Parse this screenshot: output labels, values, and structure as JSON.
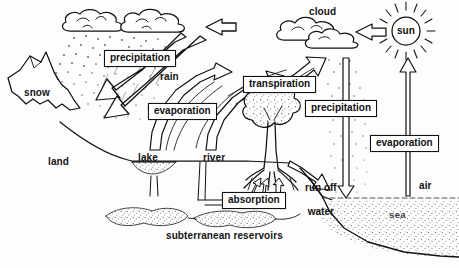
{
  "diagram": {
    "style": "hand-drawn black and white line illustration",
    "background_color": "#fdfdfc",
    "ink_color": "#111111"
  },
  "boxed_labels": [
    {
      "id": "precipitation-left",
      "text": "precipitation",
      "x": 104,
      "y": 50,
      "w": 74
    },
    {
      "id": "evaporation-left",
      "text": "evaporation",
      "x": 148,
      "y": 103,
      "w": 75
    },
    {
      "id": "transpiration",
      "text": "transpiration",
      "x": 243,
      "y": 76,
      "w": 75
    },
    {
      "id": "precipitation-right",
      "text": "precipitation",
      "x": 305,
      "y": 100,
      "w": 74
    },
    {
      "id": "evaporation-right",
      "text": "evaporation",
      "x": 370,
      "y": 135,
      "w": 75
    },
    {
      "id": "absorption",
      "text": "absorption",
      "x": 222,
      "y": 192,
      "w": 64
    }
  ],
  "plain_labels": [
    {
      "id": "cloud",
      "text": "cloud",
      "x": 309,
      "y": 7
    },
    {
      "id": "sun",
      "text": "sun",
      "x": 397,
      "y": 25
    },
    {
      "id": "rain",
      "text": "rain",
      "x": 160,
      "y": 72
    },
    {
      "id": "snow",
      "text": "snow",
      "x": 24,
      "y": 88
    },
    {
      "id": "land",
      "text": "land",
      "x": 48,
      "y": 157
    },
    {
      "id": "lake",
      "text": "lake",
      "x": 138,
      "y": 153
    },
    {
      "id": "river",
      "text": "river",
      "x": 203,
      "y": 153
    },
    {
      "id": "air",
      "text": "air",
      "x": 419,
      "y": 181
    },
    {
      "id": "sea",
      "text": "sea",
      "x": 389,
      "y": 209
    },
    {
      "id": "reservoirs",
      "text": "subterranean reservoirs",
      "x": 166,
      "y": 231
    }
  ],
  "runoff_label": {
    "id": "run-off-water",
    "line1": "run off",
    "line2": "water",
    "x": 305,
    "y": 170
  },
  "flow_arrows": [
    {
      "id": "arrow-cloud-drift-left",
      "from": "right edge",
      "to": "upper-left clouds",
      "direction": "left"
    },
    {
      "id": "arrow-sun-to-cloud",
      "from": "sun",
      "to": "cloud",
      "direction": "left"
    },
    {
      "id": "arrow-precipitation-to-snow",
      "from": "cloud",
      "to": "snow / mountain",
      "direction": "down-left"
    },
    {
      "id": "arrow-evaporation-lake",
      "from": "lake",
      "to": "clouds",
      "direction": "up-left"
    },
    {
      "id": "arrow-evaporation-river",
      "from": "river",
      "to": "clouds",
      "direction": "up-left"
    },
    {
      "id": "arrow-transpiration-tree",
      "from": "tree",
      "to": "cloud",
      "direction": "up-right"
    },
    {
      "id": "arrow-precipitation-sea",
      "from": "cloud",
      "to": "sea",
      "direction": "down"
    },
    {
      "id": "arrow-evaporation-sea",
      "from": "sea",
      "to": "cloud",
      "direction": "up"
    },
    {
      "id": "arrow-run-off-water",
      "from": "land",
      "to": "sea",
      "direction": "down-right"
    },
    {
      "id": "arrow-absorption-roots",
      "from": "soil",
      "to": "tree roots",
      "direction": "up"
    }
  ],
  "scene_objects": [
    {
      "id": "cloud-upper-left",
      "kind": "cloud"
    },
    {
      "id": "cloud-upper-mid",
      "kind": "cloud"
    },
    {
      "id": "cloud-right",
      "kind": "cloud"
    },
    {
      "id": "sun-disc",
      "kind": "sun"
    },
    {
      "id": "mountain-snow",
      "kind": "mountain"
    },
    {
      "id": "tree",
      "kind": "tree"
    },
    {
      "id": "lake-basin",
      "kind": "water-body"
    },
    {
      "id": "river-channel",
      "kind": "water-body"
    },
    {
      "id": "sea-body",
      "kind": "water-body"
    },
    {
      "id": "reservoir-left",
      "kind": "underground-water"
    },
    {
      "id": "reservoir-right",
      "kind": "underground-water"
    }
  ]
}
